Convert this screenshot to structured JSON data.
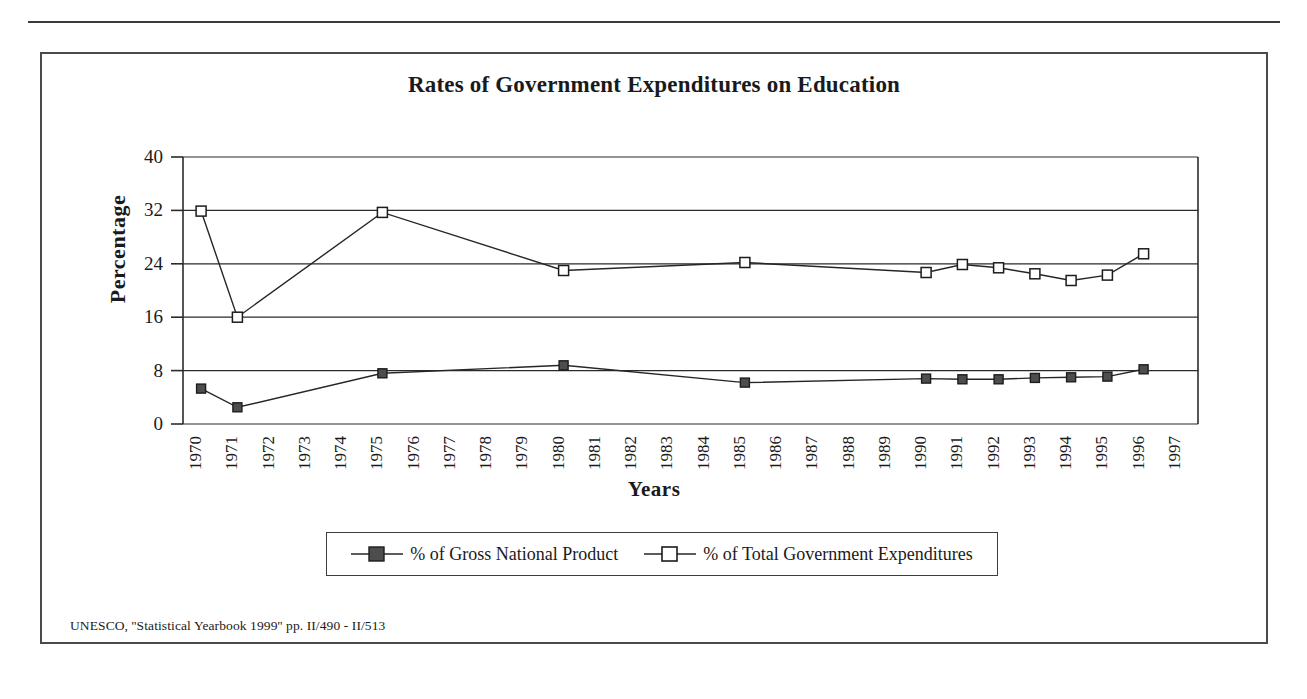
{
  "figure": {
    "title": "Rates of Government Expenditures on Education",
    "source_note": "UNESCO, ''Statistical Yearbook 1999'' pp. II/490 - II/513"
  },
  "chart_data": {
    "type": "line",
    "title": "Rates of Government Expenditures on Education",
    "xlabel": "Years",
    "ylabel": "Percentage",
    "ylim": [
      0,
      40
    ],
    "yticks": [
      0,
      8,
      16,
      24,
      32,
      40
    ],
    "grid": true,
    "legend_position": "bottom",
    "categories": [
      "1970",
      "1971",
      "1972",
      "1973",
      "1974",
      "1975",
      "1976",
      "1977",
      "1978",
      "1979",
      "1980",
      "1981",
      "1982",
      "1983",
      "1984",
      "1985",
      "1986",
      "1987",
      "1988",
      "1989",
      "1990",
      "1991",
      "1992",
      "1993",
      "1994",
      "1995",
      "1996",
      "1997"
    ],
    "series": [
      {
        "name": "% of Gross National Product",
        "marker": "filled-square",
        "x": [
          "1970",
          "1971",
          "1975",
          "1980",
          "1985",
          "1990",
          "1991",
          "1992",
          "1993",
          "1994",
          "1995",
          "1996"
        ],
        "values": [
          5.3,
          2.5,
          7.6,
          8.8,
          6.2,
          6.8,
          6.7,
          6.7,
          6.9,
          7.0,
          7.1,
          8.2
        ]
      },
      {
        "name": "% of Total Government Expenditures",
        "marker": "open-square",
        "x": [
          "1970",
          "1971",
          "1975",
          "1980",
          "1985",
          "1990",
          "1991",
          "1992",
          "1993",
          "1994",
          "1995",
          "1996"
        ],
        "values": [
          31.9,
          16.0,
          31.7,
          23.0,
          24.2,
          22.7,
          23.9,
          23.4,
          22.5,
          21.5,
          22.3,
          25.5
        ]
      }
    ]
  },
  "legend": {
    "entries": [
      {
        "label": "% of Gross National Product",
        "marker": "filled-square"
      },
      {
        "label": "% of Total Government Expenditures",
        "marker": "open-square"
      }
    ]
  }
}
